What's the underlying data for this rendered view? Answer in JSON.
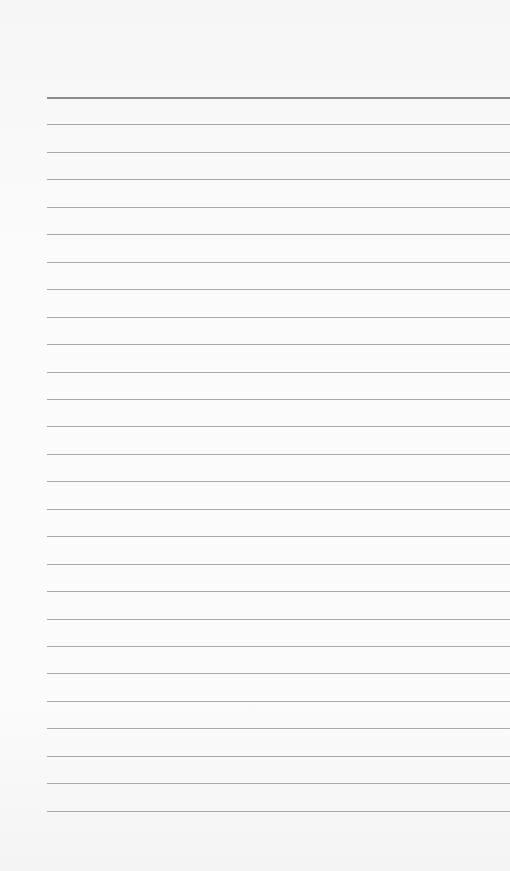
{
  "page": {
    "background": "#fbfbfb",
    "line_color": "#a9a9a9",
    "top_line_color": "#8c8c8c",
    "line_left": 47,
    "first_line_y": 97,
    "line_spacing": 27.45,
    "line_count": 27
  }
}
